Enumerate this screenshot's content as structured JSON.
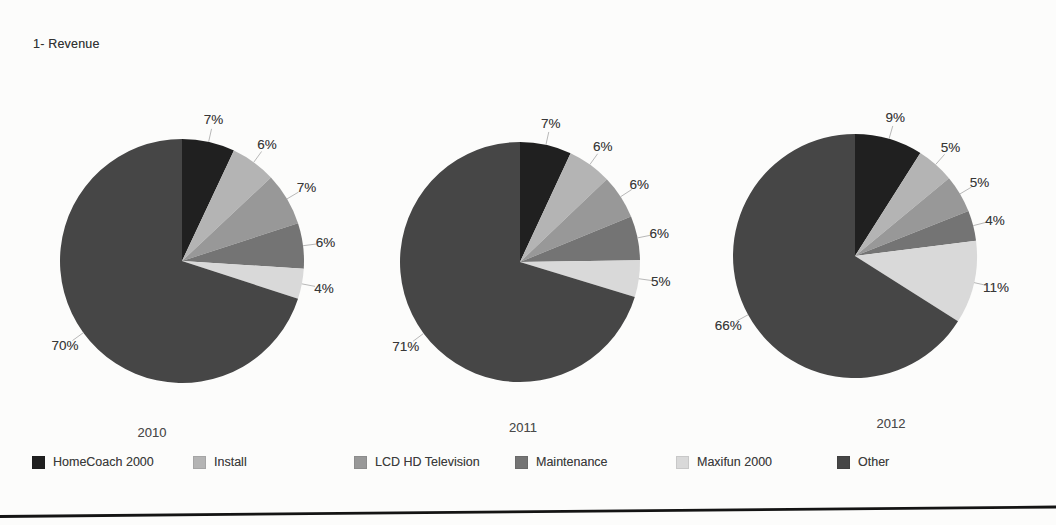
{
  "page": {
    "title": "1- Revenue"
  },
  "categories": [
    "HomeCoach 2000",
    "Install",
    "LCD HD Television",
    "Maintenance",
    "Maxifun 2000",
    "Other"
  ],
  "series_colors": [
    "#202020",
    "#b4b4b4",
    "#989898",
    "#747474",
    "#d9d9d9",
    "#464646"
  ],
  "chart_data": [
    {
      "type": "pie",
      "title": "2010",
      "categories": [
        "HomeCoach 2000",
        "Install",
        "LCD HD Television",
        "Maintenance",
        "Maxifun 2000",
        "Other"
      ],
      "values": [
        7,
        6,
        7,
        6,
        4,
        70
      ],
      "labels": [
        "7%",
        "6%",
        "7%",
        "6%",
        "4%",
        "70%"
      ],
      "legend_position": "bottom"
    },
    {
      "type": "pie",
      "title": "2011",
      "categories": [
        "HomeCoach 2000",
        "Install",
        "LCD HD Television",
        "Maintenance",
        "Maxifun 2000",
        "Other"
      ],
      "values": [
        7,
        6,
        6,
        6,
        5,
        71
      ],
      "labels": [
        "7%",
        "6%",
        "6%",
        "6%",
        "5%",
        "71%"
      ],
      "legend_position": "bottom"
    },
    {
      "type": "pie",
      "title": "2012",
      "categories": [
        "HomeCoach 2000",
        "Install",
        "LCD HD Television",
        "Maintenance",
        "Maxifun 2000",
        "Other"
      ],
      "values": [
        9,
        5,
        5,
        4,
        11,
        66
      ],
      "labels": [
        "9%",
        "5%",
        "5%",
        "4%",
        "11%",
        "66%"
      ],
      "legend_position": "bottom"
    }
  ],
  "legend": {
    "items": [
      {
        "label": "HomeCoach 2000",
        "color": "#202020"
      },
      {
        "label": "Install",
        "color": "#b4b4b4"
      },
      {
        "label": "LCD HD Television",
        "color": "#989898"
      },
      {
        "label": "Maintenance",
        "color": "#747474"
      },
      {
        "label": "Maxifun 2000",
        "color": "#d9d9d9"
      },
      {
        "label": "Other",
        "color": "#464646"
      }
    ]
  }
}
